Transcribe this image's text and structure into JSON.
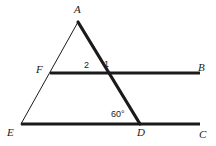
{
  "figure": {
    "kind": "geometry-diagram",
    "width": 216,
    "height": 146,
    "background_color": "#ffffff",
    "stroke_color": "#1a1a1a"
  },
  "labels": {
    "apex": "A",
    "left_mid": "F",
    "right_mid": "B",
    "bottom_left": "E",
    "bottom_mid": "D",
    "bottom_right": "C",
    "angle_one": "1",
    "angle_two": "2",
    "angle_measure": "60°"
  },
  "points": {
    "A": {
      "x": 78,
      "y": 22
    },
    "F": {
      "x": 50,
      "y": 73
    },
    "B": {
      "x": 200,
      "y": 73
    },
    "E": {
      "x": 21,
      "y": 124
    },
    "D": {
      "x": 140,
      "y": 124
    },
    "C": {
      "x": 200,
      "y": 124
    },
    "intersection": {
      "x": 98,
      "y": 73
    }
  },
  "segments": [
    {
      "name": "AE",
      "from": "A",
      "to": "E",
      "weight": "thin",
      "width": 1
    },
    {
      "name": "AD",
      "from": "A",
      "to": "D",
      "weight": "thick",
      "width": 3.2
    },
    {
      "name": "FB",
      "from": "F",
      "to": "B",
      "weight": "thick",
      "width": 3.2
    },
    {
      "name": "EC",
      "from": "E",
      "to": "C",
      "weight": "thick",
      "width": 3.2
    }
  ],
  "label_positions": {
    "A": {
      "x": 74,
      "y": 4
    },
    "F": {
      "x": 36,
      "y": 64
    },
    "B": {
      "x": 198,
      "y": 62
    },
    "E": {
      "x": 7,
      "y": 127
    },
    "D": {
      "x": 137,
      "y": 127
    },
    "C": {
      "x": 199,
      "y": 129
    },
    "angle_one": {
      "x": 104,
      "y": 60
    },
    "angle_two": {
      "x": 84,
      "y": 61
    },
    "angle_measure": {
      "x": 111,
      "y": 110
    }
  }
}
